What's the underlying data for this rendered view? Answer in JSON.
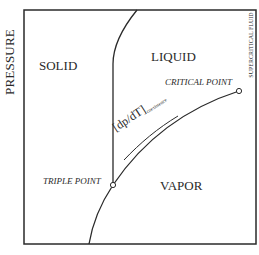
{
  "diagram": {
    "type": "phase-diagram",
    "axis": {
      "y_label": "PRESSURE"
    },
    "regions": {
      "solid": "SOLID",
      "liquid": "LIQUID",
      "vapor": "VAPOR",
      "supercritical": "SUPERCRITICAL FLUID"
    },
    "points": {
      "triple": "TRIPLE POINT",
      "critical": "CRITICAL POINT"
    },
    "annotation": {
      "slope": "[dp/dT]",
      "slope_subscript": "coexistence"
    },
    "colors": {
      "line": "#2a2a2a",
      "background": "#ffffff"
    }
  }
}
